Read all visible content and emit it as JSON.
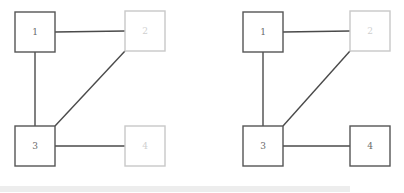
{
  "figure": {
    "background_color": "#ffffff",
    "width": 404,
    "height": 193,
    "panel_count": 2
  },
  "style": {
    "node_active_color": "#555555",
    "node_inactive_color": "#c8c8c8",
    "label_active_color": "#6a6a6a",
    "label_inactive_color": "#cfcfcf",
    "edge_color": "#4a4a4a",
    "node_fill": "#ffffff",
    "node_size": 40,
    "edge_width": 1.4,
    "node_border_width": 1.4
  },
  "scrollbar": {
    "name": "horizontal-scrollbar",
    "track_color": "#ffffff",
    "thumb_color": "#ededed",
    "thumb_left": 0,
    "thumb_width": 350,
    "thumb_top": 186,
    "thumb_height": 6
  },
  "chart_data": {
    "type": "diagram",
    "diagram_kind": "node-link-graph",
    "title": "",
    "panels": [
      {
        "name": "left-graph",
        "index": 0,
        "nodes": [
          {
            "id": "1",
            "label": "1",
            "x": 35,
            "y": 32,
            "state": "active",
            "border_color": "#555555",
            "label_color": "#6a6a6a"
          },
          {
            "id": "2",
            "label": "2",
            "x": 145,
            "y": 31,
            "state": "inactive",
            "border_color": "#c8c8c8",
            "label_color": "#cfcfcf"
          },
          {
            "id": "3",
            "label": "3",
            "x": 35,
            "y": 146,
            "state": "active",
            "border_color": "#555555",
            "label_color": "#6a6a6a"
          },
          {
            "id": "4",
            "label": "4",
            "x": 145,
            "y": 146,
            "state": "inactive",
            "border_color": "#c8c8c8",
            "label_color": "#cfcfcf"
          }
        ],
        "edges": [
          {
            "source": "1",
            "target": "2",
            "kind": "horizontal"
          },
          {
            "source": "1",
            "target": "3",
            "kind": "vertical"
          },
          {
            "source": "2",
            "target": "3",
            "kind": "diagonal"
          },
          {
            "source": "3",
            "target": "4",
            "kind": "horizontal"
          }
        ]
      },
      {
        "name": "right-graph",
        "index": 1,
        "nodes": [
          {
            "id": "1",
            "label": "1",
            "x": 61,
            "y": 32,
            "state": "active",
            "border_color": "#555555",
            "label_color": "#6a6a6a"
          },
          {
            "id": "2",
            "label": "2",
            "x": 168,
            "y": 31,
            "state": "inactive",
            "border_color": "#c8c8c8",
            "label_color": "#cfcfcf"
          },
          {
            "id": "3",
            "label": "3",
            "x": 61,
            "y": 146,
            "state": "active",
            "border_color": "#555555",
            "label_color": "#6a6a6a"
          },
          {
            "id": "4",
            "label": "4",
            "x": 168,
            "y": 146,
            "state": "active",
            "border_color": "#555555",
            "label_color": "#6a6a6a"
          }
        ],
        "edges": [
          {
            "source": "1",
            "target": "2",
            "kind": "horizontal"
          },
          {
            "source": "1",
            "target": "3",
            "kind": "vertical"
          },
          {
            "source": "2",
            "target": "3",
            "kind": "diagonal"
          },
          {
            "source": "3",
            "target": "4",
            "kind": "horizontal"
          }
        ]
      }
    ]
  }
}
